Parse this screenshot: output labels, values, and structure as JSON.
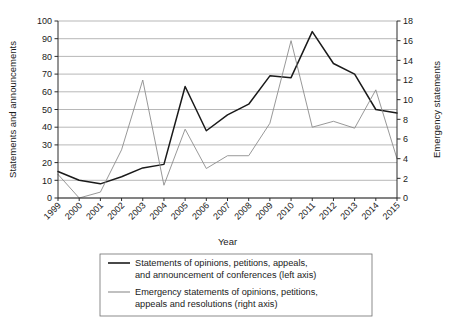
{
  "chart_data": {
    "type": "line",
    "title": "",
    "xlabel": "Year",
    "ylabel": "Statements and announcements",
    "y2label": "Emergency statements",
    "grid": true,
    "legend_position": "bottom",
    "ylim": [
      0,
      100
    ],
    "y2lim": [
      0,
      18
    ],
    "ytick_labels": [
      "0",
      "10",
      "20",
      "30",
      "40",
      "50",
      "60",
      "70",
      "80",
      "90",
      "100"
    ],
    "y2tick_labels": [
      "0",
      "2",
      "4",
      "6",
      "8",
      "10",
      "12",
      "14",
      "16",
      "18"
    ],
    "categories": [
      "1999",
      "2000",
      "2001",
      "2002",
      "2003",
      "2004",
      "2005",
      "2006",
      "2007",
      "2008",
      "2009",
      "2010",
      "2011",
      "2012",
      "2013",
      "2014",
      "2015"
    ],
    "series": [
      {
        "name": "Statements of opinions, petitions, appeals, and announcement of conferences (left axis)",
        "axis": "left",
        "color": "#1a1a1a",
        "values": [
          15,
          10,
          8,
          12,
          17,
          19,
          63,
          38,
          47,
          53,
          69,
          68,
          94,
          76,
          70,
          50,
          48
        ]
      },
      {
        "name": "Emergency statements of opinions, petitions, appeals and resolutions (right axis)",
        "axis": "right",
        "color": "#8c8c8c",
        "values": [
          2.4,
          0,
          0.6,
          4.9,
          12,
          1.3,
          7,
          3,
          4.3,
          4.3,
          7.6,
          16,
          7.2,
          7.8,
          7.1,
          11,
          4
        ]
      }
    ],
    "legend": [
      {
        "line1": "Statements of opinions, petitions, appeals,",
        "line2": "and announcement of conferences (left axis)",
        "color": "#1a1a1a"
      },
      {
        "line1": "Emergency statements of opinions, petitions,",
        "line2": "appeals and resolutions (right axis)",
        "color": "#8c8c8c"
      }
    ]
  }
}
